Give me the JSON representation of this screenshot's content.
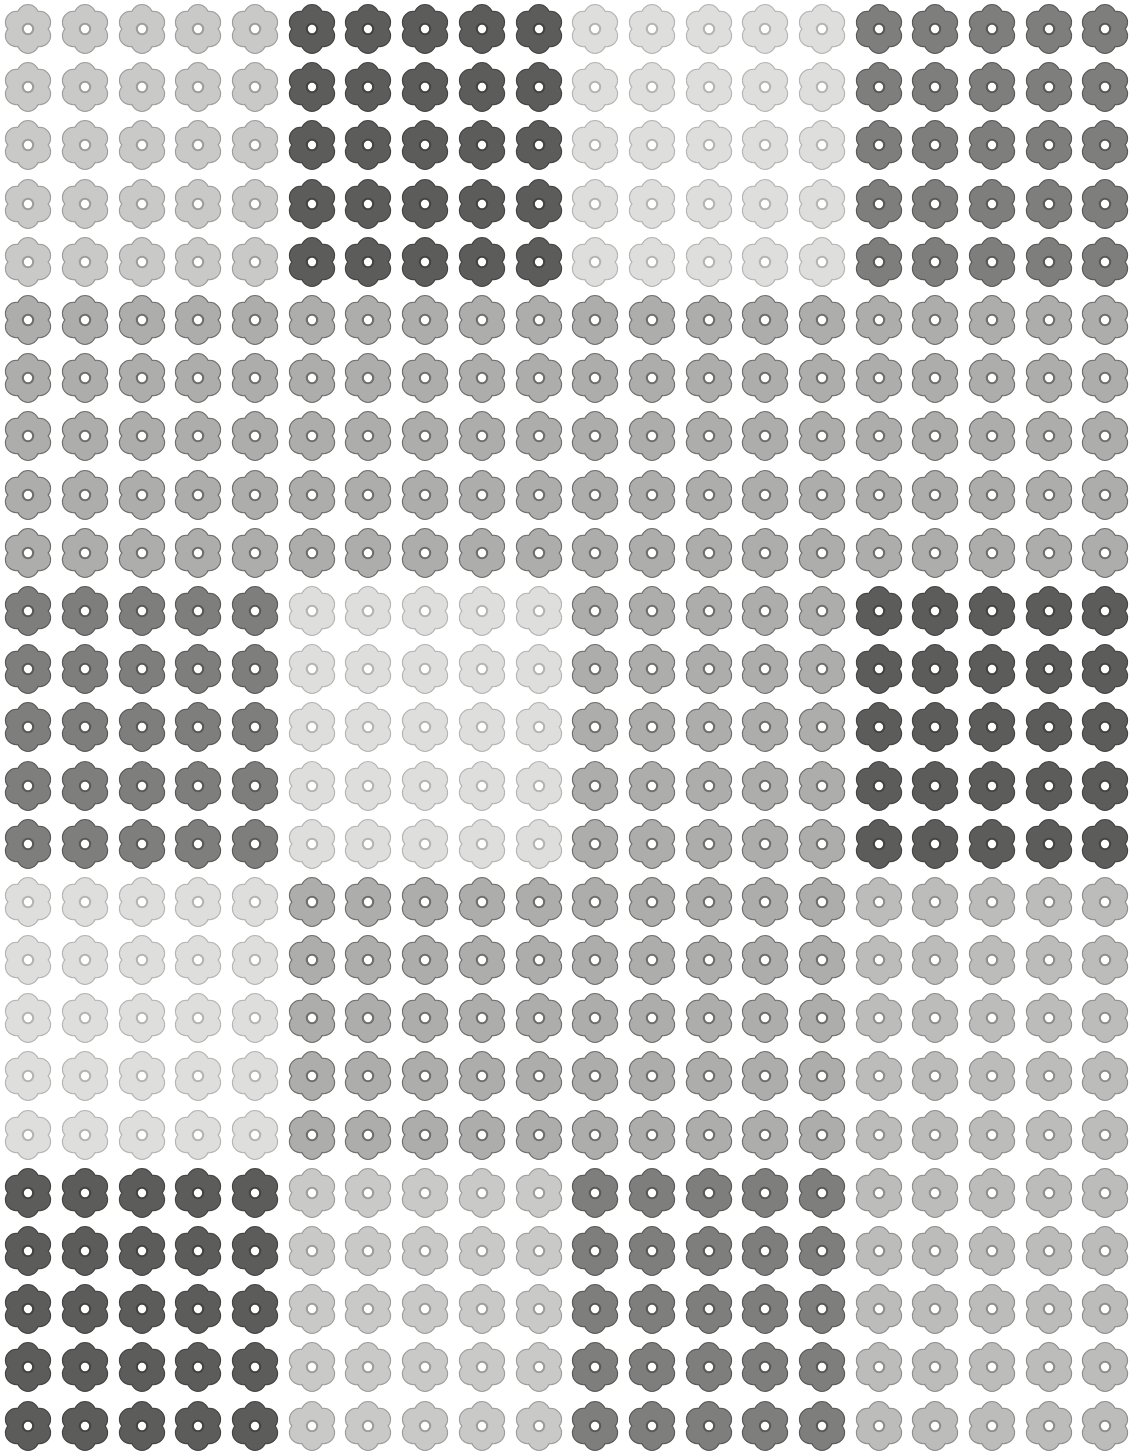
{
  "pattern": {
    "title": "Flower Icon Grid Pattern",
    "icon_name": "flower-icon",
    "columns": 20,
    "rows": 25,
    "block_columns": 5,
    "block_rows": 5,
    "block_grid_cols": 4,
    "block_grid_rows": 5,
    "background_color": "#ffffff",
    "petal_count": 6,
    "palette": {
      "very_light": {
        "fill": "#dededc",
        "stroke": "#b4b4b2",
        "name": "very-light-gray"
      },
      "light": {
        "fill": "#c9c9c7",
        "stroke": "#9d9d9b",
        "name": "light-gray"
      },
      "medium_light": {
        "fill": "#bcbcba",
        "stroke": "#8e8e8c",
        "name": "medium-light-gray"
      },
      "medium": {
        "fill": "#adadab",
        "stroke": "#6e6e6c",
        "name": "medium-gray"
      },
      "dark": {
        "fill": "#7e7e7c",
        "stroke": "#585856",
        "name": "dark-gray"
      },
      "darkest": {
        "fill": "#5c5c5a",
        "stroke": "#434341",
        "name": "darkest-gray"
      }
    },
    "blocks": [
      [
        "light",
        "darkest",
        "very_light",
        "dark"
      ],
      [
        "medium",
        "medium",
        "medium",
        "medium"
      ],
      [
        "dark",
        "very_light",
        "medium",
        "darkest"
      ],
      [
        "very_light",
        "medium",
        "medium",
        "medium_light"
      ],
      [
        "darkest",
        "light",
        "dark",
        "medium_light"
      ]
    ]
  }
}
